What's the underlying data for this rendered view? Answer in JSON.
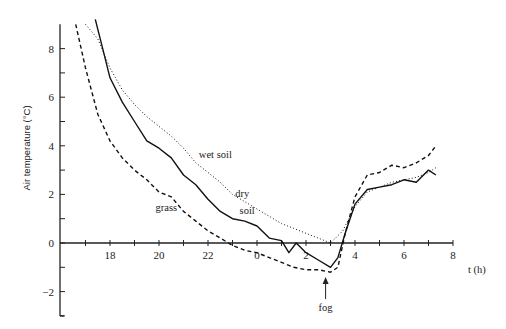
{
  "chart_data": {
    "type": "line",
    "title": "",
    "xlabel": "t (h)",
    "ylabel": "Air temperature (°C)",
    "x_tick_labels": [
      "18",
      "20",
      "22",
      "0",
      "2",
      "4",
      "6",
      "8"
    ],
    "x_tick_values_hours_rel_midnight": [
      -6,
      -4,
      -2,
      0,
      2,
      4,
      6,
      8
    ],
    "y_tick_labels": [
      "-2",
      "0",
      "2",
      "4",
      "6",
      "8"
    ],
    "ylim": [
      -3,
      9
    ],
    "xlim_hours_rel_midnight": [
      -8,
      8
    ],
    "grid": false,
    "legend": "inline annotations",
    "annotations": [
      {
        "text": "wet soil",
        "near_x": -1.7,
        "near_y": 3.5
      },
      {
        "text": "dry",
        "near_x": -0.6,
        "near_y": 1.9
      },
      {
        "text": "soil",
        "near_x": -0.4,
        "near_y": 1.2
      },
      {
        "text": "grass",
        "near_x": -3.7,
        "near_y": 1.3
      },
      {
        "text": "fog",
        "near_x": 2.8,
        "near_y": -2.8,
        "arrow_to_y": -1.4
      }
    ],
    "series": [
      {
        "name": "dry soil",
        "style": "solid",
        "x": [
          -6.6,
          -6.3,
          -6,
          -5.5,
          -5,
          -4.5,
          -4,
          -3.5,
          -3,
          -2.5,
          -2,
          -1.5,
          -1,
          -0.5,
          0,
          0.5,
          1,
          1.3,
          1.6,
          2,
          2.5,
          3,
          3.3,
          3.6,
          4,
          4.5,
          5,
          5.5,
          6,
          6.5,
          7,
          7.3
        ],
        "y": [
          9.2,
          8,
          6.8,
          5.8,
          5,
          4.2,
          3.9,
          3.5,
          2.8,
          2.4,
          1.8,
          1.3,
          1.0,
          0.9,
          0.7,
          0.2,
          0.1,
          -0.4,
          0,
          -0.4,
          -0.7,
          -1.0,
          -0.6,
          0.4,
          1.6,
          2.2,
          2.3,
          2.4,
          2.6,
          2.5,
          3.0,
          2.8
        ]
      },
      {
        "name": "wet soil",
        "style": "dotted",
        "x": [
          -7,
          -6.5,
          -6,
          -5.5,
          -5,
          -4.5,
          -4,
          -3.5,
          -3,
          -2.5,
          -2,
          -1.5,
          -1,
          -0.5,
          0,
          0.5,
          1,
          1.5,
          2,
          2.5,
          3,
          3.5,
          4,
          4.5,
          5,
          5.5,
          6,
          6.5,
          7,
          7.3
        ],
        "y": [
          9.0,
          8.4,
          7.2,
          6.3,
          5.7,
          5.2,
          4.8,
          4.4,
          3.9,
          3.3,
          2.9,
          2.5,
          2.0,
          1.7,
          1.4,
          1.1,
          0.8,
          0.6,
          0.4,
          0.2,
          0.0,
          0.5,
          1.5,
          2.1,
          2.3,
          2.5,
          2.6,
          2.7,
          2.9,
          3.1
        ]
      },
      {
        "name": "grass",
        "style": "dashed",
        "x": [
          -7.4,
          -7,
          -6.5,
          -6,
          -5.5,
          -5,
          -4.5,
          -4,
          -3.5,
          -3,
          -2.5,
          -2,
          -1.5,
          -1,
          -0.5,
          0,
          0.5,
          1,
          1.5,
          2,
          2.5,
          3,
          3.3,
          3.6,
          4,
          4.5,
          5,
          5.5,
          6,
          6.5,
          7,
          7.3
        ],
        "y": [
          9.0,
          7.2,
          5.3,
          4.2,
          3.5,
          3.0,
          2.6,
          2.1,
          1.9,
          1.3,
          0.9,
          0.5,
          0.2,
          -0.1,
          -0.3,
          -0.4,
          -0.6,
          -0.8,
          -1.0,
          -1.1,
          -1.1,
          -1.2,
          -1.0,
          0.4,
          1.9,
          2.8,
          2.9,
          3.2,
          3.1,
          3.3,
          3.6,
          4.0
        ]
      }
    ]
  }
}
